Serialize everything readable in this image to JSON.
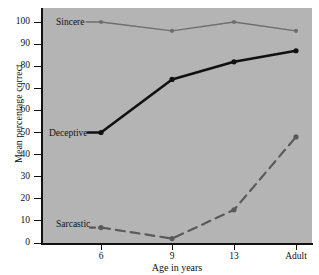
{
  "chart_data": {
    "type": "line",
    "title": "",
    "xlabel": "Age in years",
    "ylabel": "Mean percentage correct",
    "categories": [
      "6",
      "9",
      "13",
      "Adult"
    ],
    "ylim": [
      0,
      100
    ],
    "yticks": [
      0,
      10,
      20,
      30,
      40,
      50,
      60,
      70,
      80,
      90,
      100
    ],
    "ytick_labels": [
      "0",
      "10",
      "20",
      "30",
      "40",
      "50",
      "60",
      "70",
      "80",
      "90",
      "100"
    ],
    "grid": false,
    "legend_position": "inline-left",
    "background_color": "#b4b4b4",
    "series": [
      {
        "name": "Sincere",
        "values": [
          100,
          96,
          100,
          96
        ],
        "color": "#6e6e6e",
        "line_style": "solid",
        "line_width": 1.4,
        "marker": "circle"
      },
      {
        "name": "Deceptive",
        "values": [
          50,
          74,
          82,
          87
        ],
        "color": "#111111",
        "line_style": "solid",
        "line_width": 2.6,
        "marker": "circle"
      },
      {
        "name": "Sarcastic",
        "values": [
          7,
          2,
          15,
          48
        ],
        "color": "#5a5a5a",
        "line_style": "dashed",
        "line_width": 2.2,
        "marker": "circle"
      }
    ]
  },
  "axes": {
    "x_title": "Age in years",
    "y_title": "Mean percentage correct"
  },
  "series_labels": {
    "sincere": "Sincere",
    "deceptive": "Deceptive",
    "sarcastic": "Sarcastic"
  }
}
